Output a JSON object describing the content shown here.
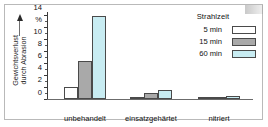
{
  "figure": {
    "y_axis_title_line1": "Gewichtsverlust",
    "y_axis_title_line2": "durch Abrasion",
    "y_unit": "%"
  },
  "legend": {
    "title": "Strahlzeit",
    "items": [
      {
        "label": "5 min",
        "color": "#ffffff"
      },
      {
        "label": "15 min",
        "color": "#a9a9a9"
      },
      {
        "label": "60 min",
        "color": "#c8ecf2"
      }
    ]
  },
  "axis": {
    "y_tick_labels": [
      "14",
      "%",
      "10",
      "8",
      "6",
      "4",
      "2",
      "0"
    ],
    "y_tick_values": [
      14,
      12,
      10,
      8,
      6,
      4,
      2,
      0
    ]
  },
  "chart_data": {
    "type": "bar",
    "title": "",
    "xlabel": "",
    "ylabel": "Gewichtsverlust durch Abrasion",
    "yunit": "%",
    "ylim": [
      0,
      14.6
    ],
    "grid": false,
    "legend_position": "top-right",
    "legend_title": "Strahlzeit",
    "categories": [
      "unbehandelt",
      "einsatzgehärtet",
      "nitriert"
    ],
    "series": [
      {
        "name": "5 min",
        "color": "#ffffff",
        "values": [
          2.1,
          0.4,
          0.15
        ]
      },
      {
        "name": "15 min",
        "color": "#a9a9a9",
        "values": [
          6.3,
          1.0,
          0.3
        ]
      },
      {
        "name": "60 min",
        "color": "#c8ecf2",
        "values": [
          13.8,
          1.5,
          0.6
        ]
      }
    ]
  }
}
